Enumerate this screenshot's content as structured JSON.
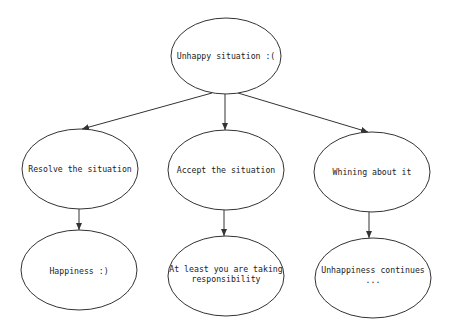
{
  "diagram": {
    "type": "tree",
    "colors": {
      "stroke": "#333333",
      "text": "#222222",
      "background": "#ffffff"
    },
    "nodes": [
      {
        "id": "root",
        "label": "Unhappy situation :(",
        "cx": 226,
        "cy": 56,
        "rx": 55,
        "ry": 38
      },
      {
        "id": "resolve",
        "label": "Resolve the situation",
        "cx": 80,
        "cy": 169,
        "rx": 58,
        "ry": 40
      },
      {
        "id": "accept",
        "label": "Accept the situation",
        "cx": 226,
        "cy": 170,
        "rx": 58,
        "ry": 40
      },
      {
        "id": "whining",
        "label": "Whining about it",
        "cx": 372,
        "cy": 172,
        "rx": 58,
        "ry": 40
      },
      {
        "id": "happiness",
        "label": "Happiness :)",
        "cx": 79,
        "cy": 270,
        "rx": 58,
        "ry": 40
      },
      {
        "id": "responsibility",
        "label": "At least you are taking\nresponsibility",
        "cx": 226,
        "cy": 276,
        "rx": 58,
        "ry": 40
      },
      {
        "id": "unhappiness",
        "label": "Unhappiness continues\n...",
        "cx": 373,
        "cy": 278,
        "rx": 58,
        "ry": 40
      }
    ],
    "edges": [
      {
        "from": "root",
        "to": "resolve"
      },
      {
        "from": "root",
        "to": "accept"
      },
      {
        "from": "root",
        "to": "whining"
      },
      {
        "from": "resolve",
        "to": "happiness"
      },
      {
        "from": "accept",
        "to": "responsibility"
      },
      {
        "from": "whining",
        "to": "unhappiness"
      }
    ]
  }
}
